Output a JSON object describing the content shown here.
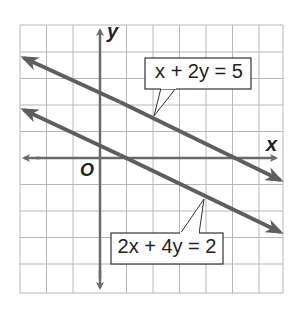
{
  "figure": {
    "type": "coordinate-plane",
    "grid": {
      "cols": 10,
      "rows": 10,
      "spacing_px": 26.5,
      "left": 20,
      "top": 25,
      "origin_px": [
        100,
        158
      ]
    },
    "axes": {
      "x_label": "x",
      "y_label": "y",
      "origin_label": "O"
    },
    "lines": [
      {
        "equation": "x + 2y = 5",
        "slope": -0.5,
        "intercept": 2.5,
        "label_text": "x + 2y = 5"
      },
      {
        "equation": "2x + 4y = 2",
        "slope": -0.5,
        "intercept": 0.5,
        "label_text": "2x + 4y = 2"
      }
    ],
    "colors": {
      "grid": "#b8b8b8",
      "axis": "#6a6a6a",
      "line": "#5e5e5e",
      "label_border": "#333333",
      "text": "#222222"
    }
  }
}
